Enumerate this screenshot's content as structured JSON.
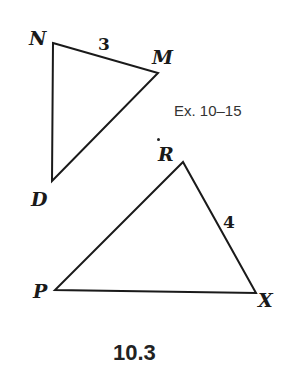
{
  "figure": {
    "number": "10.3",
    "exercise_ref": "Ex. 10–15",
    "stroke_color": "#1a1a1a",
    "background": "#ffffff"
  },
  "triangles": [
    {
      "name": "NMD",
      "vertices": {
        "N": {
          "label": "N",
          "x": 53,
          "y": 43
        },
        "M": {
          "label": "M",
          "x": 158,
          "y": 73
        },
        "D": {
          "label": "D",
          "x": 52,
          "y": 181
        }
      },
      "side_labels": [
        {
          "side": "NM",
          "value": "3"
        }
      ]
    },
    {
      "name": "RPX",
      "vertices": {
        "R": {
          "label": "R",
          "x": 183,
          "y": 162
        },
        "P": {
          "label": "P",
          "x": 55,
          "y": 290
        },
        "X": {
          "label": "X",
          "x": 256,
          "y": 293
        }
      },
      "side_labels": [
        {
          "side": "RX",
          "value": "4"
        }
      ]
    }
  ]
}
